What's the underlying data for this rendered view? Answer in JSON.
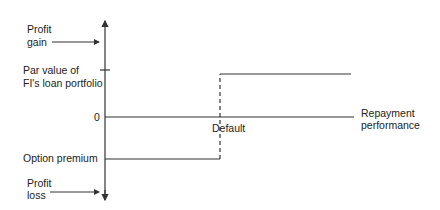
{
  "diagram": {
    "type": "payoff-step-diagram",
    "y_axis": {
      "top_label_line1": "Profit",
      "top_label_line2": "gain",
      "bottom_label_line1": "Profit",
      "bottom_label_line2": "loss",
      "tick_labels": {
        "par_line1": "Par value of",
        "par_line2": "FI's loan portfolio",
        "zero": "0",
        "premium": "Option premium"
      }
    },
    "x_axis": {
      "label_line1": "Repayment",
      "label_line2": "performance"
    },
    "annotations": {
      "default": "Default"
    },
    "colors": {
      "line": "#333333",
      "text": "#222222",
      "background": "#ffffff"
    }
  }
}
